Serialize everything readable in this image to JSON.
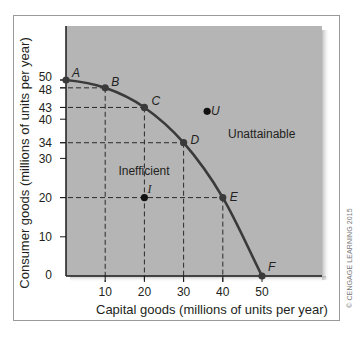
{
  "chart_data": {
    "type": "line",
    "title": "",
    "xlabel": "Capital goods (millions of units per year)",
    "ylabel": "Consumer goods (millions of units per year)",
    "xlim": [
      0,
      55
    ],
    "ylim": [
      0,
      55
    ],
    "x_ticks": [
      10,
      20,
      30,
      40,
      50
    ],
    "y_ticks": [
      0,
      10,
      20,
      30,
      34,
      40,
      43,
      48,
      50
    ],
    "grid": false,
    "legend": null,
    "series": [
      {
        "name": "Production possibilities frontier",
        "points": [
          {
            "label": "A",
            "x": 0,
            "y": 50
          },
          {
            "label": "B",
            "x": 10,
            "y": 48
          },
          {
            "label": "C",
            "x": 20,
            "y": 43
          },
          {
            "label": "D",
            "x": 30,
            "y": 34
          },
          {
            "label": "E",
            "x": 40,
            "y": 20
          },
          {
            "label": "F",
            "x": 50,
            "y": 0
          }
        ]
      }
    ],
    "extra_points": [
      {
        "label": "I",
        "x": 20,
        "y": 20,
        "meaning": "Inefficient"
      },
      {
        "label": "U",
        "x": 36,
        "y": 42,
        "meaning": "Unattainable"
      }
    ],
    "annotations": [
      {
        "text": "Inefficient",
        "x": 20,
        "y": 26
      },
      {
        "text": "Unattainable",
        "x": 48,
        "y": 36
      }
    ]
  },
  "labels": {
    "xlabel": "Capital goods (millions of units per year)",
    "ylabel": "Consumer goods (millions of units per year)",
    "inefficient": "Inefficient",
    "unattainable": "Unattainable",
    "copyright": "© CENGAGE LEARNING 2015"
  },
  "colors": {
    "plot_bg": "#b5b5b5",
    "curve": "#3a3a3a",
    "axis": "#1a1a1a",
    "text": "#231f20"
  }
}
